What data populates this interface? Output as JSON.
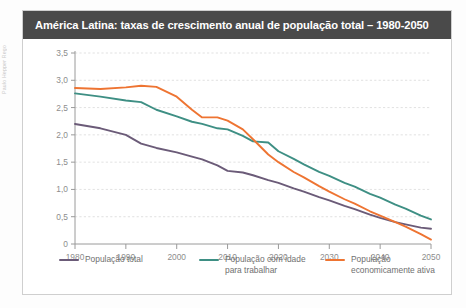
{
  "credit": "Paulo Hepper Rego",
  "card": {
    "title": "América Latina: taxas de crescimento anual de população total – 1980-2050"
  },
  "legend": [
    {
      "label": "População total",
      "color": "#6b5b78",
      "icon": "line-swatch"
    },
    {
      "label": "População com idade para trabalhar",
      "color": "#3e8f84",
      "icon": "line-swatch"
    },
    {
      "label": "População economicamente ativa",
      "color": "#ee7432",
      "icon": "line-swatch"
    }
  ],
  "chart_data": {
    "type": "line",
    "title": "América Latina: taxas de crescimento anual de população total – 1980-2050",
    "xlabel": "",
    "ylabel": "",
    "xlim": [
      1980,
      2050
    ],
    "ylim": [
      0,
      3.5
    ],
    "grid": true,
    "legend_position": "bottom",
    "xticks": [
      1980,
      1990,
      2000,
      2010,
      2020,
      2030,
      2040,
      2050
    ],
    "xtick_labels": [
      "1980",
      "1990",
      "2000",
      "2010",
      "2020",
      "2030",
      "2040",
      "2050"
    ],
    "yticks": [
      0,
      0.5,
      1.0,
      1.5,
      2.0,
      2.5,
      3.0,
      3.5
    ],
    "ytick_labels": [
      "0",
      "0,5",
      "1,0",
      "1,5",
      "2,0",
      "2,5",
      "3,0",
      "3,5"
    ],
    "x": [
      1980,
      1985,
      1990,
      1993,
      1996,
      2000,
      2003,
      2005,
      2008,
      2010,
      2013,
      2015,
      2018,
      2020,
      2023,
      2025,
      2028,
      2030,
      2033,
      2035,
      2038,
      2040,
      2043,
      2045,
      2048,
      2050
    ],
    "series": [
      {
        "name": "População total",
        "color": "#6b5b78",
        "values": [
          2.2,
          2.12,
          2.0,
          1.84,
          1.76,
          1.68,
          1.6,
          1.55,
          1.44,
          1.34,
          1.31,
          1.26,
          1.17,
          1.12,
          1.02,
          0.96,
          0.86,
          0.8,
          0.7,
          0.64,
          0.54,
          0.48,
          0.4,
          0.36,
          0.3,
          0.28
        ]
      },
      {
        "name": "População com idade para trabalhar",
        "color": "#3e8f84",
        "values": [
          2.76,
          2.7,
          2.63,
          2.6,
          2.46,
          2.34,
          2.24,
          2.2,
          2.12,
          2.1,
          1.98,
          1.88,
          1.86,
          1.7,
          1.56,
          1.46,
          1.32,
          1.25,
          1.12,
          1.05,
          0.92,
          0.85,
          0.72,
          0.65,
          0.52,
          0.45
        ]
      },
      {
        "name": "População economicamente ativa",
        "color": "#ee7432",
        "values": [
          2.86,
          2.84,
          2.87,
          2.9,
          2.88,
          2.7,
          2.46,
          2.32,
          2.32,
          2.26,
          2.1,
          1.92,
          1.64,
          1.5,
          1.32,
          1.22,
          1.06,
          0.96,
          0.82,
          0.74,
          0.6,
          0.52,
          0.4,
          0.32,
          0.18,
          0.08
        ]
      }
    ]
  }
}
